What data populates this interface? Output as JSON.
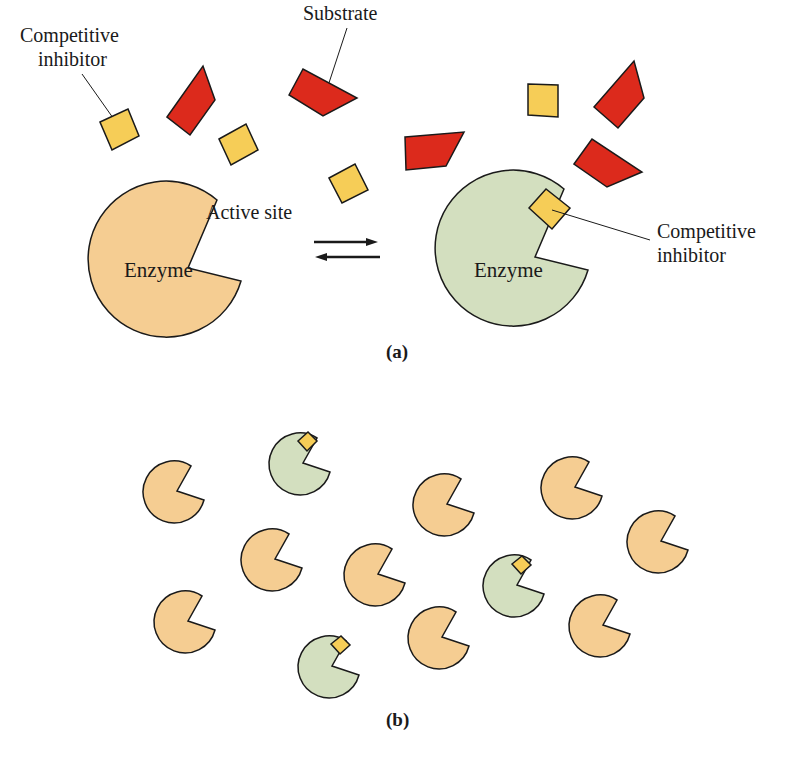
{
  "panel_a": {
    "caption": "(a)",
    "labels": {
      "competitive_inhibitor_top_line1": "Competitive",
      "competitive_inhibitor_top_line2": "inhibitor",
      "substrate": "Substrate",
      "active_site": "Active site",
      "enzyme_left": "Enzyme",
      "enzyme_right": "Enzyme",
      "competitive_inhibitor_right_line1": "Competitive",
      "competitive_inhibitor_right_line2": "inhibitor"
    },
    "equilibrium_arrows": "reversible"
  },
  "panel_b": {
    "caption": "(b)",
    "free_enzymes": 10,
    "inhibited_enzymes": 3
  },
  "colors": {
    "enzyme_free": "#f5cd92",
    "enzyme_inhibited": "#d3dfbf",
    "substrate": "#dc2a1c",
    "inhibitor": "#f6cd57",
    "outline": "#1a1a1a"
  }
}
